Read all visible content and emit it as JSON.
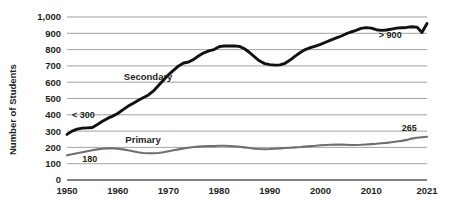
{
  "chart_data": {
    "type": "line",
    "title": "",
    "xlabel": "",
    "ylabel": "Number of Students",
    "xlim": [
      1950,
      2021
    ],
    "ylim": [
      0,
      1000
    ],
    "grid": true,
    "legend_position": "inline-labels",
    "y_ticks": [
      "0",
      "100",
      "200",
      "300",
      "400",
      "500",
      "600",
      "700",
      "800",
      "900",
      "1,000"
    ],
    "y_tick_values": [
      0,
      100,
      200,
      300,
      400,
      500,
      600,
      700,
      800,
      900,
      1000
    ],
    "x_ticks": [
      "1950",
      "1960",
      "1970",
      "1980",
      "1990",
      "2000",
      "2010",
      "2021"
    ],
    "x_tick_values": [
      1950,
      1960,
      1970,
      1980,
      1990,
      2000,
      2010,
      2021
    ],
    "annotations": [
      {
        "name": "secondary-start-annotation",
        "text": "< 300",
        "x": 1951,
        "y": 380
      },
      {
        "name": "secondary-end-annotation",
        "text": "> 900",
        "x": 2016,
        "y": 870
      },
      {
        "name": "primary-start-annotation",
        "text": "180",
        "x": 1953,
        "y": 108
      },
      {
        "name": "primary-end-annotation",
        "text": "265",
        "x": 2019,
        "y": 300
      }
    ],
    "series": [
      {
        "name": "Secondary",
        "label": "Secondary",
        "color": "#111111",
        "label_x": 1966,
        "label_y": 615,
        "x": [
          1950,
          1951,
          1952,
          1953,
          1954,
          1955,
          1956,
          1957,
          1958,
          1959,
          1960,
          1961,
          1962,
          1963,
          1964,
          1965,
          1966,
          1967,
          1968,
          1969,
          1970,
          1971,
          1972,
          1973,
          1974,
          1975,
          1976,
          1977,
          1978,
          1979,
          1980,
          1981,
          1982,
          1983,
          1984,
          1985,
          1986,
          1987,
          1988,
          1989,
          1990,
          1991,
          1992,
          1993,
          1994,
          1995,
          1996,
          1997,
          1998,
          1999,
          2000,
          2001,
          2002,
          2003,
          2004,
          2005,
          2006,
          2007,
          2008,
          2009,
          2010,
          2011,
          2012,
          2013,
          2014,
          2015,
          2016,
          2017,
          2018,
          2019,
          2020,
          2021
        ],
        "values": [
          280,
          300,
          312,
          318,
          320,
          322,
          340,
          360,
          378,
          392,
          408,
          430,
          452,
          470,
          488,
          505,
          520,
          545,
          578,
          612,
          645,
          672,
          700,
          718,
          724,
          740,
          762,
          780,
          792,
          800,
          818,
          822,
          822,
          822,
          820,
          805,
          782,
          755,
          730,
          714,
          708,
          705,
          706,
          716,
          736,
          760,
          782,
          800,
          812,
          822,
          832,
          845,
          858,
          870,
          882,
          896,
          908,
          918,
          930,
          935,
          932,
          922,
          918,
          920,
          926,
          932,
          934,
          936,
          940,
          938,
          905,
          960
        ]
      },
      {
        "name": "Primary",
        "label": "Primary",
        "color": "#6d6e70",
        "label_x": 1965,
        "label_y": 230,
        "x": [
          1950,
          1951,
          1952,
          1953,
          1954,
          1955,
          1956,
          1957,
          1958,
          1959,
          1960,
          1961,
          1962,
          1963,
          1964,
          1965,
          1966,
          1967,
          1968,
          1969,
          1970,
          1971,
          1972,
          1973,
          1974,
          1975,
          1976,
          1977,
          1978,
          1979,
          1980,
          1981,
          1982,
          1983,
          1984,
          1985,
          1986,
          1987,
          1988,
          1989,
          1990,
          1991,
          1992,
          1993,
          1994,
          1995,
          1996,
          1997,
          1998,
          1999,
          2000,
          2001,
          2002,
          2003,
          2004,
          2005,
          2006,
          2007,
          2008,
          2009,
          2010,
          2011,
          2012,
          2013,
          2014,
          2015,
          2016,
          2017,
          2018,
          2019,
          2020,
          2021
        ],
        "values": [
          152,
          158,
          164,
          170,
          176,
          182,
          188,
          192,
          194,
          194,
          192,
          188,
          182,
          176,
          170,
          166,
          164,
          164,
          166,
          170,
          176,
          182,
          188,
          194,
          198,
          202,
          205,
          207,
          208,
          209,
          210,
          210,
          209,
          207,
          204,
          200,
          196,
          192,
          190,
          189,
          190,
          192,
          194,
          196,
          198,
          200,
          202,
          205,
          208,
          210,
          213,
          215,
          216,
          217,
          217,
          216,
          215,
          215,
          216,
          218,
          220,
          222,
          225,
          228,
          232,
          236,
          240,
          246,
          254,
          259,
          262,
          265
        ]
      }
    ]
  }
}
